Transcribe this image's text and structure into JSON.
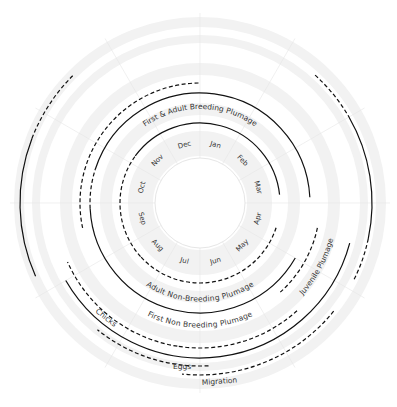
{
  "diagram": {
    "center": [
      200,
      203
    ],
    "months": [
      "Jan",
      "Feb",
      "Mar",
      "Apr",
      "May",
      "Jun",
      "Jul",
      "Aug",
      "Sep",
      "Oct",
      "Nov",
      "Dec"
    ],
    "colors": {
      "band": "#f2f2f2",
      "grid": "#e6e6e6",
      "line": "#111111",
      "text": "#333333"
    },
    "bands": [
      {
        "r0": 47,
        "r1": 72
      },
      {
        "r0": 88,
        "r1": 100
      },
      {
        "r0": 128,
        "r1": 140
      },
      {
        "r0": 160,
        "r1": 168
      },
      {
        "r0": 176,
        "r1": 186
      }
    ],
    "arcs": [
      {
        "name": "first-adult-breeding-inner",
        "r": 80,
        "from": 10.2,
        "to": 2.8,
        "style": "solid"
      },
      {
        "name": "adult-non-breeding-dashed-left",
        "r": 80,
        "from": 7.6,
        "to": 10.2,
        "style": "dashed"
      },
      {
        "name": "adult-non-breeding",
        "r": 80,
        "from": 3.6,
        "to": 7.6,
        "style": "dashed"
      },
      {
        "name": "first-adult-breeding-outer",
        "r": 110,
        "from": 9.6,
        "to": 2.9,
        "style": "solid"
      },
      {
        "name": "first-adult-breeding-dashed",
        "r": 110,
        "from": 8.9,
        "to": 9.6,
        "style": "dashed"
      },
      {
        "name": "first-non-breeding",
        "r": 110,
        "from": 4.0,
        "to": 8.9,
        "style": "solid"
      },
      {
        "name": "juvenile-dashed",
        "r": 120,
        "from": 3.4,
        "to": 4.6,
        "style": "dashed"
      },
      {
        "name": "juvenile-long-dashed",
        "r": 120,
        "from": 8.6,
        "to": 0.0,
        "style": "dashed"
      },
      {
        "name": "juvenile-plumage",
        "r": 145,
        "from": 4.6,
        "to": 6.3,
        "style": "dashed"
      },
      {
        "name": "chicks",
        "r": 145,
        "from": 6.3,
        "to": 8.2,
        "style": "dashed"
      },
      {
        "name": "eggs-solid",
        "r": 155,
        "from": 3.5,
        "to": 8.0,
        "style": "solid"
      },
      {
        "name": "eggs",
        "r": 163,
        "from": 5.9,
        "to": 7.3,
        "style": "dashed"
      },
      {
        "name": "migration-left",
        "r": 180,
        "from": 8.2,
        "to": 9.7,
        "style": "solid"
      },
      {
        "name": "migration-right",
        "r": 172,
        "from": 2.0,
        "to": 3.4,
        "style": "solid"
      },
      {
        "name": "migration-right-dashed",
        "r": 172,
        "from": 1.4,
        "to": 2.0,
        "style": "dashed"
      },
      {
        "name": "migration-right-dashed2",
        "r": 172,
        "from": 3.4,
        "to": 3.9,
        "style": "dashed"
      },
      {
        "name": "migration-left-dashed",
        "r": 180,
        "from": 9.7,
        "to": 10.5,
        "style": "dashed"
      },
      {
        "name": "migration",
        "r": 172,
        "from": 4.3,
        "to": 6.2,
        "style": "dashed"
      }
    ],
    "labels": {
      "first_adult_breeding": "First & Adult Breeding Plumage",
      "adult_non_breeding": "Adult Non-Breeding Plumage",
      "first_non_breeding": "First Non Breeding Plumage",
      "juvenile": "Juvenile Plumage",
      "chicks": "Chicks",
      "eggs": "Eggs",
      "migration": "Migration"
    }
  }
}
